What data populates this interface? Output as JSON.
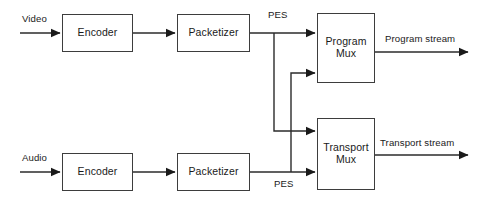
{
  "diagram": {
    "type": "block-flow-diagram",
    "colors": {
      "background": "#ffffff",
      "line": "#2b2b2b",
      "box_border": "#3d3d3d",
      "text": "#1a1a1a"
    },
    "nodes": [
      {
        "id": "video-encoder",
        "label": "Encoder",
        "x": 62,
        "y": 14,
        "w": 71,
        "h": 38
      },
      {
        "id": "video-packetizer",
        "label": "Packetizer",
        "x": 177,
        "y": 14,
        "w": 73,
        "h": 38
      },
      {
        "id": "program-mux",
        "label": "Program\nMux",
        "x": 317,
        "y": 13,
        "w": 58,
        "h": 70
      },
      {
        "id": "audio-encoder",
        "label": "Encoder",
        "x": 62,
        "y": 153,
        "w": 71,
        "h": 38
      },
      {
        "id": "audio-packetizer",
        "label": "Packetizer",
        "x": 177,
        "y": 153,
        "w": 73,
        "h": 38
      },
      {
        "id": "transport-mux",
        "label": "Transport\nMux",
        "x": 317,
        "y": 118,
        "w": 58,
        "h": 72
      }
    ],
    "edge_labels": [
      {
        "id": "video-input-label",
        "text": "Video",
        "x": 22,
        "y": 13
      },
      {
        "id": "video-pes-label",
        "text": "PES",
        "x": 268,
        "y": 9
      },
      {
        "id": "program-output-label",
        "text": "Program stream",
        "x": 385,
        "y": 33
      },
      {
        "id": "audio-input-label",
        "text": "Audio",
        "x": 22,
        "y": 152
      },
      {
        "id": "audio-pes-label",
        "text": "PES",
        "x": 274,
        "y": 178
      },
      {
        "id": "transport-output-label",
        "text": "Transport stream",
        "x": 380,
        "y": 137
      }
    ],
    "connections": [
      {
        "id": "video-source-to-encoder",
        "from": "video-source",
        "to": "video-encoder",
        "label": "Video"
      },
      {
        "id": "video-encoder-to-packetizer",
        "from": "video-encoder",
        "to": "video-packetizer",
        "label": ""
      },
      {
        "id": "video-packetizer-to-program",
        "from": "video-packetizer",
        "to": "program-mux",
        "label": "PES"
      },
      {
        "id": "video-packetizer-to-transport",
        "from": "video-packetizer",
        "to": "transport-mux",
        "label": "PES"
      },
      {
        "id": "audio-source-to-encoder",
        "from": "audio-source",
        "to": "audio-encoder",
        "label": "Audio"
      },
      {
        "id": "audio-encoder-to-packetizer",
        "from": "audio-encoder",
        "to": "audio-packetizer",
        "label": ""
      },
      {
        "id": "audio-packetizer-to-transport",
        "from": "audio-packetizer",
        "to": "transport-mux",
        "label": "PES"
      },
      {
        "id": "audio-packetizer-to-program",
        "from": "audio-packetizer",
        "to": "program-mux",
        "label": "PES"
      },
      {
        "id": "program-mux-output",
        "from": "program-mux",
        "to": "program-stream",
        "label": "Program stream"
      },
      {
        "id": "transport-mux-output",
        "from": "transport-mux",
        "to": "transport-stream",
        "label": "Transport stream"
      }
    ]
  }
}
